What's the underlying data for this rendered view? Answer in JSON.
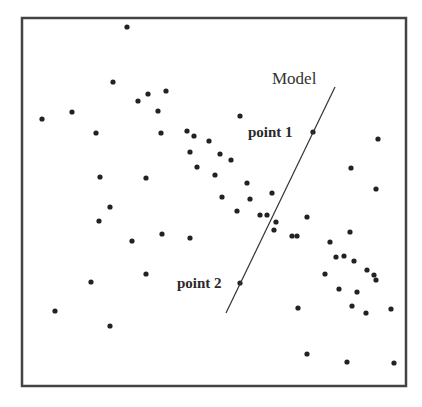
{
  "figure": {
    "frame": {
      "x": 22,
      "y": 18,
      "width": 384,
      "height": 368,
      "stroke": "#444444",
      "stroke_width": 2.5
    },
    "dot_color": "#222222",
    "dot_radius": 2.6,
    "model_line": {
      "label": "Model",
      "x1": 335,
      "y1": 87,
      "x2": 226,
      "y2": 313,
      "stroke": "#333333",
      "label_x": 272,
      "label_y": 84
    },
    "annotations": [
      {
        "label": "point 1",
        "dot_x": 313,
        "dot_y": 132,
        "label_x": 248,
        "label_y": 137
      },
      {
        "label": "point 2",
        "dot_x": 240,
        "dot_y": 283,
        "label_x": 177,
        "label_y": 288
      }
    ]
  },
  "chart_data": {
    "type": "scatter",
    "title": "",
    "xlabel": "",
    "ylabel": "",
    "grid": false,
    "legend": "none",
    "coordinate_space": "image pixels (origin top-left)",
    "points": [
      [
        127,
        27
      ],
      [
        42,
        119
      ],
      [
        72,
        112
      ],
      [
        113,
        82
      ],
      [
        96,
        133
      ],
      [
        138,
        101
      ],
      [
        148,
        94
      ],
      [
        166,
        91
      ],
      [
        158,
        111
      ],
      [
        161,
        133
      ],
      [
        100,
        177
      ],
      [
        110,
        207
      ],
      [
        99,
        221
      ],
      [
        132,
        241
      ],
      [
        146,
        178
      ],
      [
        162,
        234
      ],
      [
        190,
        238
      ],
      [
        146,
        274
      ],
      [
        91,
        282
      ],
      [
        55,
        311
      ],
      [
        110,
        326
      ],
      [
        187,
        131
      ],
      [
        194,
        136
      ],
      [
        209,
        141
      ],
      [
        190,
        152
      ],
      [
        220,
        154
      ],
      [
        231,
        160
      ],
      [
        197,
        167
      ],
      [
        215,
        175
      ],
      [
        247,
        183
      ],
      [
        222,
        197
      ],
      [
        250,
        199
      ],
      [
        237,
        211
      ],
      [
        272,
        193
      ],
      [
        260,
        215
      ],
      [
        267,
        215
      ],
      [
        276,
        222
      ],
      [
        274,
        230
      ],
      [
        292,
        236
      ],
      [
        297,
        236
      ],
      [
        307,
        217
      ],
      [
        240,
        116
      ],
      [
        313,
        132
      ],
      [
        240,
        283
      ],
      [
        378,
        139
      ],
      [
        351,
        168
      ],
      [
        376,
        189
      ],
      [
        330,
        242
      ],
      [
        350,
        232
      ],
      [
        336,
        257
      ],
      [
        344,
        256
      ],
      [
        354,
        261
      ],
      [
        367,
        270
      ],
      [
        376,
        280
      ],
      [
        374,
        275
      ],
      [
        325,
        274
      ],
      [
        339,
        289
      ],
      [
        357,
        292
      ],
      [
        352,
        306
      ],
      [
        366,
        313
      ],
      [
        391,
        309
      ],
      [
        298,
        308
      ],
      [
        307,
        354
      ],
      [
        347,
        362
      ],
      [
        394,
        363
      ]
    ],
    "line": {
      "name": "Model",
      "from": [
        335,
        87
      ],
      "to": [
        226,
        313
      ]
    },
    "annotations": [
      "Model",
      "point 1",
      "point 2"
    ]
  }
}
